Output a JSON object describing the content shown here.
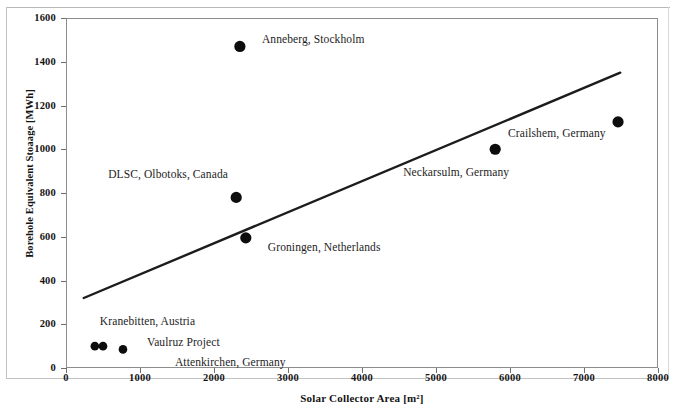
{
  "chart_data": {
    "type": "scatter",
    "title": "",
    "xlabel": "Solar Collector Area [m²]",
    "ylabel": "Borehole Equivalent Stoaage [MWh]",
    "xlim": [
      0,
      8000
    ],
    "ylim": [
      0,
      1600
    ],
    "xticks": [
      0,
      1000,
      2000,
      3000,
      4000,
      5000,
      6000,
      7000,
      8000
    ],
    "yticks": [
      0,
      200,
      400,
      600,
      800,
      1000,
      1200,
      1400,
      1600
    ],
    "xtick_labels": [
      "0",
      "1000",
      "2000",
      "3000",
      "4000",
      "5000",
      "6000",
      "7000",
      "8000"
    ],
    "ytick_labels": [
      "0",
      "200",
      "400",
      "600",
      "800",
      "1000",
      "1200",
      "1400",
      "1600"
    ],
    "grid": false,
    "legend": "none",
    "marker_color": "#0d0d0d",
    "line_color": "#1c1c1c",
    "points": [
      {
        "name": "Anneberg, Stockholm",
        "x": 2350,
        "y": 1470,
        "label_dx": 22,
        "label_dy": -6
      },
      {
        "name": "DLSC, Olbotoks, Canada",
        "x": 2300,
        "y": 780,
        "label_dx": -128,
        "label_dy": -22
      },
      {
        "name": "Groningen, Netherlands",
        "x": 2430,
        "y": 595,
        "label_dx": 22,
        "label_dy": 10
      },
      {
        "name": "Neckarsulm, Germany",
        "x": 5800,
        "y": 1000,
        "label_dx": -92,
        "label_dy": 24
      },
      {
        "name": "Crailshem, Germany",
        "x": 7460,
        "y": 1125,
        "label_dx": -110,
        "label_dy": 12
      },
      {
        "name": "Kranebitten, Austria",
        "x": 390,
        "y": 100,
        "label_dx": 5,
        "label_dy": -24
      },
      {
        "name": "Vaulruz Project",
        "x": 500,
        "y": 100,
        "label_dx": 44,
        "label_dy": -3
      },
      {
        "name": "Attenkirchen, Germany",
        "x": 770,
        "y": 85,
        "label_dx": 52,
        "label_dy": 14
      }
    ],
    "trendline": {
      "name": "linear-trend",
      "x_start": 240,
      "y_start": 320,
      "x_end": 7490,
      "y_end": 1350
    },
    "annotations": [
      "Anneberg, Stockholm",
      "DLSC, Olbotoks, Canada",
      "Groningen, Netherlands",
      "Neckarsulm, Germany",
      "Crailshem, Germany",
      "Kranebitten, Austria",
      "Vaulruz Project",
      "Attenkirchen, Germany"
    ]
  }
}
